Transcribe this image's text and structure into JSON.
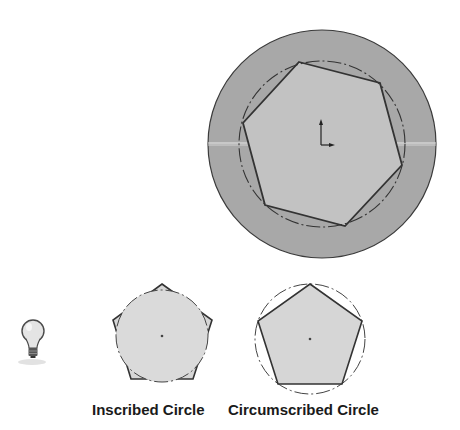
{
  "labels": {
    "inscribed": "Inscribed Circle",
    "circumscribed": "Circumscribed Circle"
  },
  "icons": {
    "tip": "lightbulb-icon"
  },
  "colors": {
    "background": "#ffffff",
    "disc_fill": "#a8a8a8",
    "polygon_fill": "#d4d4d4",
    "stroke": "#333333"
  },
  "figures": [
    {
      "name": "construction-disc-with-heptagon",
      "polygon_sides": 7
    },
    {
      "name": "pentagon-inscribed-circle",
      "polygon_sides": 5
    },
    {
      "name": "pentagon-circumscribed-circle",
      "polygon_sides": 5
    }
  ]
}
